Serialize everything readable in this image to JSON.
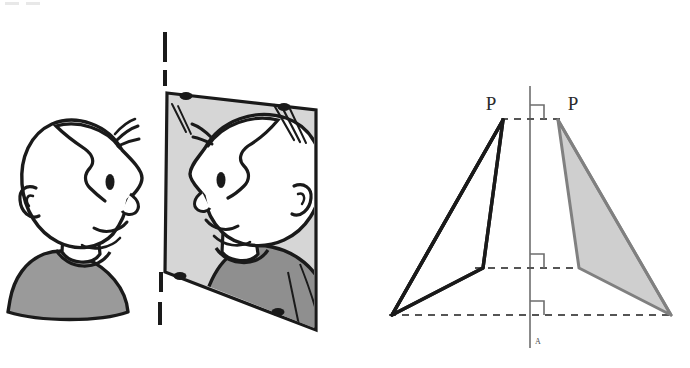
{
  "figure": {
    "background_color": "#ffffff",
    "width": 690,
    "height": 368
  },
  "colors": {
    "ink": "#1a1a1a",
    "mirror_glass": "#d6d6d6",
    "sweater_gray": "#9a9a9a",
    "sweater_gray_mirror": "#8f8f8f",
    "shape_fill": "#cfcfcf",
    "shape_stroke": "#808080",
    "axis_gray": "#6e6e6e",
    "dashed_gray": "#555555",
    "white": "#ffffff"
  },
  "left_panel": {
    "name": "boy-facing-mirror-scene",
    "description": "Cartoon boy in profile facing right, looking at his reflection in a wall mirror",
    "subject": {
      "name": "boy-profile",
      "facing": "right",
      "hair_style": "quiff",
      "sweater_color": "#9a9a9a"
    },
    "mirror_plane": {
      "name": "mirror-plane-dashed-line",
      "style": "dashed",
      "orientation": "vertical"
    },
    "mirror": {
      "name": "wall-mirror",
      "glass_color": "#d6d6d6",
      "corner_mount_count": 4,
      "shine_streaks": 3,
      "reflection_label": "reflected image of the boy"
    }
  },
  "right_panel": {
    "name": "reflection-geometry-diagram",
    "axis": {
      "name": "mirror-axis",
      "label": "A",
      "orientation": "vertical",
      "color": "#6e6e6e"
    },
    "right_angle_marks": {
      "count": 3,
      "label": "right-angle (90°) marks where dashed connectors meet the mirror axis"
    },
    "dashed_connectors": {
      "count": 3,
      "description": "horizontal dashed lines joining each object vertex to its image vertex through the mirror axis"
    },
    "object_shape": {
      "name": "object-quadrilateral",
      "apex_label": "P",
      "fill": "none",
      "stroke": "#1a1a1a",
      "side": "left"
    },
    "image_shape": {
      "name": "image-quadrilateral",
      "apex_label": "P",
      "fill": "#cfcfcf",
      "stroke": "#808080",
      "side": "right"
    },
    "labels": {
      "apex_object": "P",
      "apex_image": "P",
      "axis_foot": "A"
    }
  }
}
